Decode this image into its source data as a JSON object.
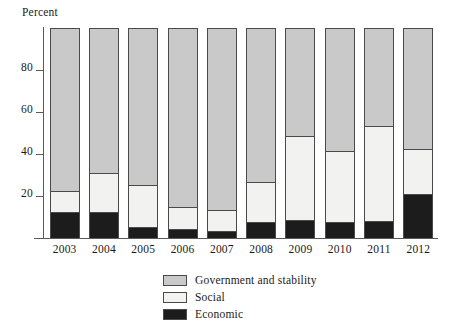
{
  "chart_data": {
    "type": "bar",
    "stacked": true,
    "title": "",
    "subtitle": "",
    "xlabel": "",
    "ylabel": "Percent",
    "ylim": [
      0,
      100
    ],
    "yticks": [
      20,
      40,
      60,
      80
    ],
    "ytick_labels": [
      "20",
      "40",
      "60",
      "80"
    ],
    "grid": false,
    "legend_position": "bottom",
    "categories": [
      "2003",
      "2004",
      "2005",
      "2006",
      "2007",
      "2008",
      "2009",
      "2010",
      "2011",
      "2012"
    ],
    "series": [
      {
        "name": "Economic",
        "color": "#1c1c1c",
        "values": [
          12,
          12,
          5,
          4,
          3,
          7,
          8,
          7,
          7.5,
          20.5
        ]
      },
      {
        "name": "Social",
        "color": "#f2f2f0",
        "values": [
          10,
          18.5,
          20,
          10.3,
          10,
          19,
          40,
          34,
          45.5,
          21.5
        ]
      },
      {
        "name": "Government and stability",
        "color": "#c9c9c9",
        "values": [
          78,
          69.5,
          75,
          85.7,
          87,
          74,
          52,
          59,
          47,
          58
        ]
      }
    ],
    "stack_order_bottom_to_top": [
      "Economic",
      "Social",
      "Government and stability"
    ]
  },
  "legend": {
    "items": [
      {
        "label": "Government and stability",
        "color": "#c9c9c9"
      },
      {
        "label": "Social",
        "color": "#f2f2f0"
      },
      {
        "label": "Economic",
        "color": "#1c1c1c"
      }
    ]
  },
  "colors": {
    "government": "#c9c9c9",
    "social": "#f2f2f0",
    "economic": "#1c1c1c",
    "axis": "#5a5a5a",
    "outline": "#4a4a4a",
    "background": "#ffffff",
    "text": "#1a1a1a"
  }
}
